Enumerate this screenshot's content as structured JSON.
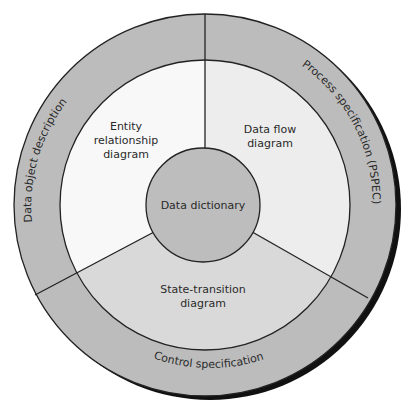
{
  "diagram": {
    "center_label": "Data dictionary",
    "inner_regions": [
      {
        "id": "erd",
        "lines": [
          "Entity",
          "relationship",
          "diagram"
        ]
      },
      {
        "id": "dfd",
        "lines": [
          "Data flow",
          "diagram"
        ]
      },
      {
        "id": "std",
        "lines": [
          "State-transition",
          "diagram"
        ]
      }
    ],
    "outer_regions": [
      {
        "id": "dod",
        "label": "Data object description"
      },
      {
        "id": "pspec",
        "label": "Process specification (PSPEC)"
      },
      {
        "id": "cspec",
        "label": "Control specification"
      }
    ],
    "colors": {
      "outer_ring": "#bcbcbc",
      "center_circle": "#bdbdbd",
      "erd_fill": "#f8f8f8",
      "dfd_fill": "#ededed",
      "std_fill": "#d9d9d9",
      "stroke": "#222222",
      "shadow": "#111111"
    }
  }
}
